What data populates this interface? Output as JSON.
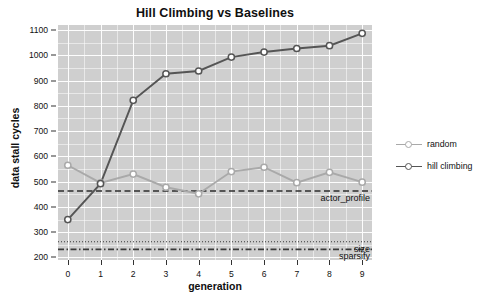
{
  "chart_data": {
    "type": "line",
    "title": "Hill Climbing vs Baselines",
    "xlabel": "generation",
    "ylabel": "data stall cycles",
    "x": [
      0,
      1,
      2,
      3,
      4,
      5,
      6,
      7,
      8,
      9
    ],
    "xtick_labels": [
      "0",
      "1",
      "2",
      "3",
      "4",
      "5",
      "6",
      "7",
      "8",
      "9"
    ],
    "ytick_labels": [
      "200",
      "300",
      "400",
      "500",
      "600",
      "700",
      "800",
      "900",
      "1000",
      "1100"
    ],
    "yticks": [
      200,
      300,
      400,
      500,
      600,
      700,
      800,
      900,
      1000,
      1100
    ],
    "xlim": [
      -0.3,
      9.3
    ],
    "ylim": [
      190,
      1120
    ],
    "grid": true,
    "legend_position": "right",
    "series": [
      {
        "name": "random",
        "color": "#a9a9a9",
        "marker": "open-circle",
        "values": [
          565,
          495,
          530,
          478,
          452,
          540,
          557,
          496,
          537,
          498
        ]
      },
      {
        "name": "hill climbing",
        "color": "#555555",
        "marker": "open-circle",
        "values": [
          350,
          492,
          822,
          927,
          938,
          993,
          1013,
          1027,
          1038,
          1087
        ]
      }
    ],
    "reference_lines": [
      {
        "label": "actor_profile",
        "value": 463,
        "style": "dashed",
        "color": "#2e2e2e"
      },
      {
        "label": "size",
        "value": 262,
        "style": "dotted",
        "color": "#3a3a3a"
      },
      {
        "label": "sparsify",
        "value": 232,
        "style": "dashdot",
        "color": "#3a3a3a"
      }
    ]
  },
  "colors": {
    "panel_background": "#cfcfcf",
    "gridline": "#fdfdfd",
    "figure_background": "#ffffff",
    "text": "#111111"
  }
}
